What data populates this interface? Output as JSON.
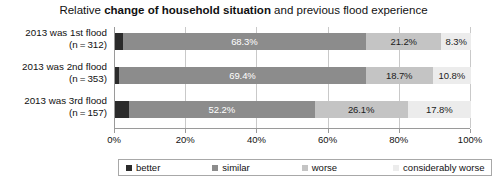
{
  "chart_data": {
    "type": "bar",
    "subtype": "stacked-horizontal-100pct",
    "title_plain_1": "Relative ",
    "title_bold": "change of household situation",
    "title_plain_2": " and previous flood experience",
    "title": "Relative change of household situation and previous flood experience",
    "xlabel": "",
    "ylabel": "",
    "xlim": [
      0,
      100
    ],
    "grid": true,
    "legend_position": "bottom",
    "categories": [
      {
        "line1": "2013 was 1st flood",
        "line2": "(n = 312)",
        "n": 312
      },
      {
        "line1": "2013 was 2nd flood",
        "line2": "(n = 353)",
        "n": 353
      },
      {
        "line1": "2013 was 3rd flood",
        "line2": "(n = 157)",
        "n": 157
      }
    ],
    "series": [
      {
        "name": "better",
        "color": "#2b2b2b",
        "values": [
          2.2,
          1.1,
          3.9
        ],
        "labels": [
          "",
          "",
          ""
        ],
        "label_color": "light"
      },
      {
        "name": "similar",
        "color": "#8c8c8c",
        "values": [
          68.3,
          69.4,
          52.2
        ],
        "labels": [
          "68.3%",
          "69.4%",
          "52.2%"
        ],
        "label_color": "light"
      },
      {
        "name": "worse",
        "color": "#c4c4c4",
        "values": [
          21.2,
          18.7,
          26.1
        ],
        "labels": [
          "21.2%",
          "18.7%",
          "26.1%"
        ],
        "label_color": "dark"
      },
      {
        "name": "considerably worse",
        "color": "#ececec",
        "values": [
          8.3,
          10.8,
          17.8
        ],
        "labels": [
          "8.3%",
          "10.8%",
          "17.8%"
        ],
        "label_color": "dark"
      }
    ],
    "xticks": [
      {
        "value": 0,
        "label": "0%"
      },
      {
        "value": 20,
        "label": "20%"
      },
      {
        "value": 40,
        "label": "40%"
      },
      {
        "value": 60,
        "label": "60%"
      },
      {
        "value": 80,
        "label": "80%"
      },
      {
        "value": 100,
        "label": "100%"
      }
    ]
  }
}
